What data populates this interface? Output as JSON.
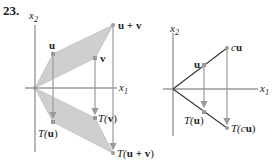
{
  "problem": {
    "number": "23."
  },
  "colors": {
    "axis": "#9a9a9a",
    "fill": "#cfcfcf",
    "vector": "#3a3a3a",
    "point": "#9a9a9a",
    "text": "#222222"
  },
  "left_diagram": {
    "axis_labels": {
      "x1": "x",
      "x1_sub": "1",
      "x2": "x",
      "x2_sub": "2"
    },
    "points": {
      "u": {
        "label": "u"
      },
      "v": {
        "label": "v"
      },
      "u_plus_v": {
        "label": "u + v"
      },
      "T_u": {
        "label_fn": "T(",
        "label_arg": "u",
        "label_close": ")"
      },
      "T_v": {
        "label_fn": "T(",
        "label_arg": "v",
        "label_close": ")"
      },
      "T_u_plus_v": {
        "label_fn": "T(",
        "label_arg": "u + v",
        "label_close": ")"
      }
    },
    "description": "Parallelogram spanned by u and v is reflected through the x1-axis by T; arrows drop from u, v, u+v to T(u), T(v), T(u+v)."
  },
  "right_diagram": {
    "axis_labels": {
      "x1": "x",
      "x1_sub": "1",
      "x2": "x",
      "x2_sub": "2"
    },
    "points": {
      "u": {
        "label": "u"
      },
      "cu": {
        "label_c": "c",
        "label_u": "u"
      },
      "T_u": {
        "label_fn": "T(",
        "label_arg": "u",
        "label_close": ")"
      },
      "T_cu": {
        "label_fn": "T(",
        "label_c": "c",
        "label_arg": "u",
        "label_close": ")"
      }
    },
    "description": "Vector u and its scalar multiple cu along a line through origin are reflected to T(u) and T(cu)."
  }
}
